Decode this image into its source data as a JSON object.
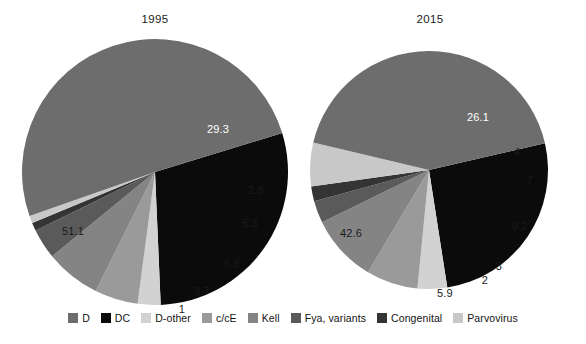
{
  "figure": {
    "background": "#ffffff",
    "type": "two-pie-comparison"
  },
  "legend": {
    "position": "bottom-center",
    "items": [
      {
        "label": "D",
        "color": "#6d6d6d"
      },
      {
        "label": "DC",
        "color": "#0b0b0b"
      },
      {
        "label": "D-other",
        "color": "#d2d2d2"
      },
      {
        "label": "c/cE",
        "color": "#9a9a9a"
      },
      {
        "label": "Kell",
        "color": "#848484"
      },
      {
        "label": "Fya, variants",
        "color": "#5a5a5a"
      },
      {
        "label": "Congenital",
        "color": "#343434"
      },
      {
        "label": "Parvovirus",
        "color": "#c8c8c8"
      }
    ]
  },
  "charts": [
    {
      "id": "pie-1995",
      "title": "1995",
      "cx": 133,
      "cy": 133,
      "r": 133,
      "start_angle_deg": -17,
      "labels": {
        "29.3": {
          "x": 63,
          "y": -42,
          "color": "#ffffff"
        },
        "2.8": {
          "x": 101,
          "y": 19,
          "color": "#1a1a1a"
        },
        "5.3": {
          "x": 95,
          "y": 52,
          "color": "#1a1a1a"
        },
        "6.8": {
          "x": 77,
          "y": 92,
          "color": "#1a1a1a"
        },
        "3.7": {
          "x": 47,
          "y": 120,
          "color": "#1a1a1a"
        },
        "1": {
          "x": 27,
          "y": 138,
          "color": "#1a1a1a"
        },
        "51.1": {
          "x": -82,
          "y": 60,
          "color": "#1a1a1a"
        }
      }
    },
    {
      "id": "pie-2015",
      "title": "2015",
      "cx": 119,
      "cy": 119,
      "r": 119,
      "start_angle_deg": -13,
      "labels": {
        "26.1": {
          "x": 49,
          "y": -52,
          "color": "#ffffff"
        },
        "4": {
          "x": 88,
          "y": -17,
          "color": "#1a1a1a"
        },
        "7": {
          "x": 101,
          "y": 11,
          "color": "#1a1a1a"
        },
        "9.2": {
          "x": 91,
          "y": 57,
          "color": "#1a1a1a"
        },
        "3": {
          "x": 70,
          "y": 97,
          "color": "#1a1a1a"
        },
        "2": {
          "x": 56,
          "y": 111,
          "color": "#1a1a1a"
        },
        "5.9": {
          "x": 16,
          "y": 124,
          "color": "#1a1a1a"
        },
        "42.6": {
          "x": -78,
          "y": 64,
          "color": "#1a1a1a"
        }
      }
    }
  ],
  "chart_data": [
    {
      "type": "pie",
      "title": "1995",
      "categories": [
        "DC",
        "D-other",
        "c/cE",
        "Kell",
        "Fya, variants",
        "Congenital",
        "Parvovirus",
        "D"
      ],
      "values": [
        29.3,
        2.8,
        5.3,
        6.8,
        3.7,
        1,
        0.9,
        51.1
      ],
      "data_labels": [
        "29.3",
        "2.8",
        "5.3",
        "6.8",
        "3.7",
        "1",
        "",
        "51.1"
      ],
      "colors": [
        "#0b0b0b",
        "#d2d2d2",
        "#9a9a9a",
        "#848484",
        "#5a5a5a",
        "#343434",
        "#c8c8c8",
        "#6d6d6d"
      ],
      "units": "percent",
      "legend": "bottom",
      "xlabel": "",
      "ylabel": ""
    },
    {
      "type": "pie",
      "title": "2015",
      "categories": [
        "DC",
        "D-other",
        "c/cE",
        "Kell",
        "Fya, variants",
        "Congenital",
        "Parvovirus",
        "D"
      ],
      "values": [
        26.1,
        4,
        7,
        9.2,
        3,
        2,
        5.9,
        42.6
      ],
      "data_labels": [
        "26.1",
        "4",
        "7",
        "9.2",
        "3",
        "2",
        "5.9",
        "42.6"
      ],
      "colors": [
        "#0b0b0b",
        "#d2d2d2",
        "#9a9a9a",
        "#848484",
        "#5a5a5a",
        "#343434",
        "#c8c8c8",
        "#6d6d6d"
      ],
      "units": "percent",
      "legend": "bottom",
      "xlabel": "",
      "ylabel": ""
    }
  ]
}
